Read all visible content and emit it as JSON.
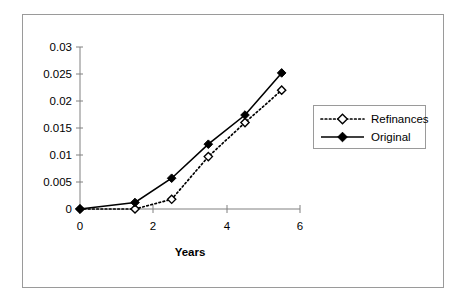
{
  "chart_data": {
    "type": "line",
    "title": "",
    "subtitle": "",
    "xlabel": "Years",
    "ylabel": "",
    "x": [
      0,
      1.5,
      2.5,
      3.5,
      4.5,
      5.5
    ],
    "xlim": [
      0,
      6
    ],
    "ylim": [
      0,
      0.03
    ],
    "xticks": [
      0,
      2,
      4,
      6
    ],
    "xtick_labels": [
      "0",
      "2",
      "4",
      "6"
    ],
    "yticks": [
      0,
      0.005,
      0.01,
      0.015,
      0.02,
      0.025,
      0.03
    ],
    "ytick_labels": [
      "0",
      "0.005",
      "0.01",
      "0.015",
      "0.02",
      "0.025",
      "0.03"
    ],
    "grid": false,
    "legend_position": "right",
    "series": [
      {
        "name": "Refinances",
        "values": [
          0,
          0.0,
          0.0018,
          0.0097,
          0.016,
          0.022
        ],
        "line_style": "dotted",
        "marker": "open-diamond",
        "color": "#000000"
      },
      {
        "name": "Original",
        "values": [
          0,
          0.0012,
          0.0057,
          0.012,
          0.0174,
          0.0252
        ],
        "line_style": "solid",
        "marker": "filled-diamond",
        "color": "#000000"
      }
    ]
  },
  "legend": {
    "entries": [
      {
        "label": "Refinances"
      },
      {
        "label": "Original"
      }
    ]
  },
  "axes": {
    "x_title": "Years"
  },
  "colors": {
    "frame": "#9a9a9a",
    "axis": "#808080",
    "ink": "#000000",
    "background": "#ffffff"
  }
}
